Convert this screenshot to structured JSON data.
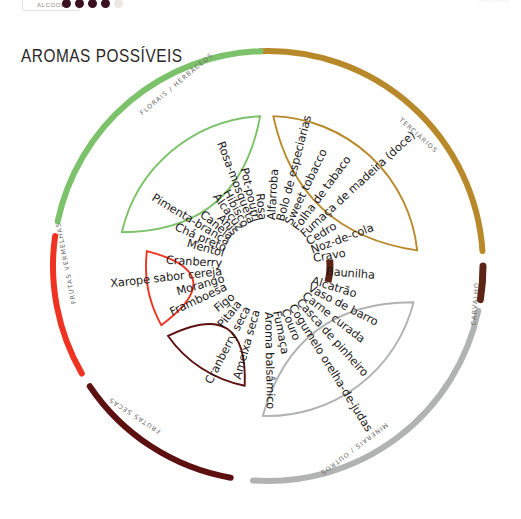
{
  "header": {
    "alcool_label": "ALCOOL",
    "alcool_dots_filled": 4,
    "alcool_dots_total": 5,
    "alcool_dot_color": "#3b1020",
    "alcool_dot_empty_color": "#ebe7e4",
    "right_label": "AROMAS"
  },
  "title": "AROMAS POSSÍVEIS",
  "chart_data": {
    "type": "pie",
    "title": "AROMAS POSSÍVEIS",
    "legend_position": "on-arc",
    "groups": [
      {
        "name": "TERCIÁRIOS",
        "color": "#b8892a",
        "arc_start_deg": -92,
        "arc_end_deg": -4,
        "items": [
          "Alfarroba",
          "Bolo de especiarias",
          "Sweet tobacco",
          "Folha de tabaco",
          "Fumaça de madeira (doce)",
          "Cedro",
          "Noz-de-cola",
          "Cravo"
        ]
      },
      {
        "name": "CARVALHO",
        "color": "#5c2414",
        "arc_start_deg": 0,
        "arc_end_deg": 9,
        "items": [
          "Baunilha"
        ]
      },
      {
        "name": "MINERAIS / OUTROS",
        "color": "#b0b3b2",
        "arc_start_deg": 12,
        "arc_end_deg": 94,
        "items": [
          "Alcatrão",
          "Vaso de barro",
          "Carne curada",
          "Casca de pinheiro",
          "Cogumelo orelha-de-judas",
          "Couro",
          "Fumaça",
          "Aroma balsâmico"
        ]
      },
      {
        "name": "FRUTAS SECAS",
        "color": "#5c1010",
        "arc_start_deg": 100,
        "arc_end_deg": 146,
        "items": [
          "Ameixa seca",
          "Cranberry seca",
          "Pitaia",
          "Figo"
        ]
      },
      {
        "name": "FRUTAS VERMELHAS",
        "color": "#ee3322",
        "arc_start_deg": 150,
        "arc_end_deg": 188,
        "items": [
          "Framboesa",
          "Morango",
          "Xarope sabor cereja",
          "Cranberry"
        ]
      },
      {
        "name": "FLORAIS / HERBÁCEOS",
        "color": "#7cc26a",
        "arc_start_deg": 192,
        "arc_end_deg": 268,
        "items": [
          "Mentol",
          "Chá preto",
          "Pimenta-branca",
          "Canela",
          "Anis",
          "Alcaçuz",
          "Hibisco",
          "Rosa-mosqueta",
          "Pot-pourri",
          "Rosa"
        ]
      }
    ]
  }
}
